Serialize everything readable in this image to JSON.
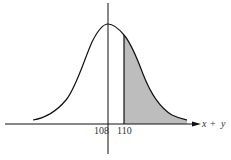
{
  "figure": {
    "type": "normal-distribution-curve",
    "mean_label": "108",
    "cutoff_label": "110",
    "axis_label_x": "x",
    "axis_label_op": "+",
    "axis_label_y": "y",
    "shaded_region": "right tail beyond 110",
    "colors": {
      "curve": "#111111",
      "axes": "#111111",
      "shade": "#bdbdbd",
      "text": "#333333"
    }
  }
}
